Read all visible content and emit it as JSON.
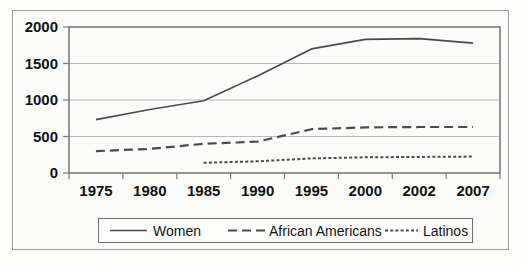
{
  "chart_data": {
    "type": "line",
    "title": "",
    "subtitle": "",
    "xlabel": "",
    "ylabel": "",
    "categories": [
      "1975",
      "1980",
      "1985",
      "1990",
      "1995",
      "2000",
      "2002",
      "2007"
    ],
    "yticks": [
      "0",
      "500",
      "1000",
      "1500",
      "2000"
    ],
    "ylim": [
      0,
      2000
    ],
    "grid": true,
    "legend_position": "bottom",
    "series": [
      {
        "name": "Women",
        "style": "solid",
        "color": "#4a4a4a",
        "values": [
          730,
          870,
          990,
          1330,
          1700,
          1830,
          1840,
          1780
        ]
      },
      {
        "name": "African Americans",
        "style": "dashed",
        "color": "#4a4a4a",
        "values": [
          300,
          330,
          400,
          430,
          600,
          625,
          630,
          630
        ]
      },
      {
        "name": "Latinos",
        "style": "dotted",
        "color": "#4a4a4a",
        "values": [
          null,
          null,
          140,
          160,
          200,
          215,
          220,
          225
        ]
      }
    ]
  },
  "axes": {
    "y_tick_labels": [
      "2000",
      "1500",
      "1000",
      "500",
      "0"
    ],
    "x_tick_labels": [
      "1975",
      "1980",
      "1985",
      "1990",
      "1995",
      "2000",
      "2002",
      "2007"
    ]
  },
  "legend": {
    "items": [
      {
        "label": "Women",
        "style": "solid"
      },
      {
        "label": "African Americans",
        "style": "dashed"
      },
      {
        "label": "Latinos",
        "style": "dotted"
      }
    ]
  },
  "colors": {
    "line": "#4a4a4a",
    "grid": "#b9b9b9",
    "axis": "#7a7a7a",
    "frame": "#9a9a9a",
    "background": "#fdfdfc",
    "text": "#111111"
  }
}
